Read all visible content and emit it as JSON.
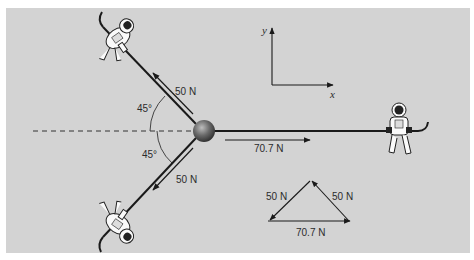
{
  "figure": {
    "background": "#d3d3d3",
    "line_color": "#1a1a1a",
    "axes": {
      "x_label": "x",
      "y_label": "y"
    },
    "forces": {
      "upper_left": {
        "label": "50 N",
        "angle_label": "45°"
      },
      "lower_left": {
        "label": "50 N",
        "angle_label": "45°"
      },
      "right": {
        "label": "70.7 N"
      }
    },
    "vector_triangle": {
      "left_side_label": "50 N",
      "right_side_label": "50 N",
      "base_label": "70.7 N"
    },
    "objects": [
      "astronaut-upper-left",
      "astronaut-lower-left",
      "astronaut-right",
      "ball"
    ]
  }
}
